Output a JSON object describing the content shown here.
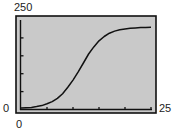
{
  "chart_data": {
    "type": "line",
    "title": "",
    "xlabel": "",
    "ylabel": "",
    "xlim": [
      0,
      25
    ],
    "ylim": [
      0,
      250
    ],
    "grid": false,
    "legend": null,
    "x_tick_step": 5,
    "y_tick_step": 50,
    "window_labels": {
      "ymax": "250",
      "ymin": "0",
      "xmin": "0",
      "xmax": "25"
    },
    "series": [
      {
        "name": "logistic curve",
        "x": [
          0,
          1,
          2,
          3,
          4,
          5,
          6,
          7,
          8,
          9,
          10,
          11,
          12,
          13,
          14,
          15,
          16,
          17,
          18,
          19,
          20,
          21,
          22,
          23,
          24,
          25
        ],
        "y": [
          4,
          5,
          6,
          8,
          11,
          16,
          22,
          31,
          44,
          62,
          82,
          105,
          130,
          155,
          175,
          192,
          204,
          213,
          219,
          223,
          225,
          227,
          228,
          229,
          229,
          230
        ]
      }
    ]
  },
  "colors": {
    "plot_background": "#c9c9c9",
    "frame": "#111111",
    "curve": "#111111",
    "text": "#222222"
  }
}
